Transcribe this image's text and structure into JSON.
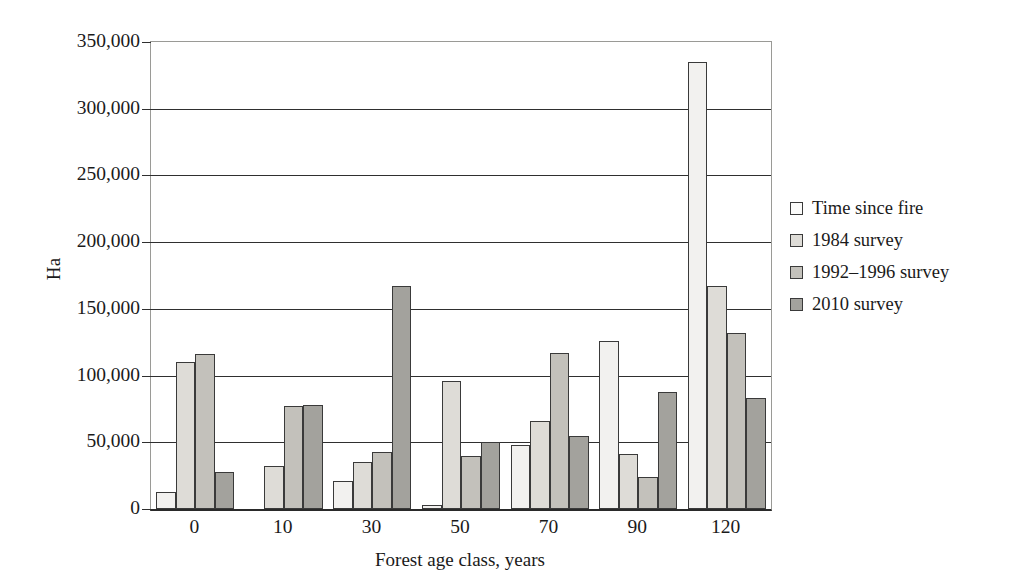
{
  "chart_data": {
    "type": "bar",
    "title": "",
    "xlabel": "Forest age class, years",
    "ylabel": "Ha",
    "categories": [
      "0",
      "10",
      "30",
      "50",
      "70",
      "90",
      "120"
    ],
    "series": [
      {
        "name": "Time since  fire",
        "color": "#f2f1ef",
        "values": [
          13000,
          0,
          21000,
          3000,
          48000,
          126000,
          335000
        ]
      },
      {
        "name": "1984 survey",
        "color": "#dedcd7",
        "values": [
          110000,
          32000,
          35000,
          96000,
          66000,
          41000,
          167000
        ]
      },
      {
        "name": "1992–1996 survey",
        "color": "#c3c1bb",
        "values": [
          116000,
          77000,
          43000,
          40000,
          117000,
          24000,
          132000
        ]
      },
      {
        "name": "2010 survey",
        "color": "#a3a29d",
        "values": [
          28000,
          78000,
          167000,
          50000,
          55000,
          88000,
          83000
        ]
      }
    ],
    "ylim": [
      0,
      350000
    ],
    "ytick_values": [
      0,
      50000,
      100000,
      150000,
      200000,
      250000,
      300000,
      350000
    ],
    "ytick_labels": [
      "0",
      "50,000",
      "100,000",
      "150,000",
      "200,000",
      "250,000",
      "300,000",
      "350,000"
    ],
    "grid": true,
    "legend_position": "right",
    "axis_color": "#2f2f2f",
    "background": "#ffffff"
  },
  "legend": {
    "items": [
      {
        "label": "Time since  fire"
      },
      {
        "label": "1984 survey"
      },
      {
        "label": "1992–1996 survey"
      },
      {
        "label": "2010 survey"
      }
    ]
  }
}
